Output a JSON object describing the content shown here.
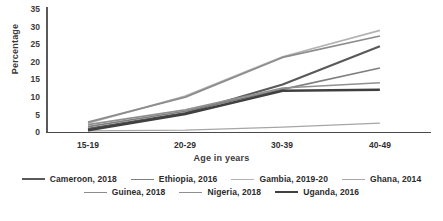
{
  "chart_data": {
    "type": "line",
    "title": "",
    "xlabel": "Age in years",
    "ylabel": "Percentage",
    "categories": [
      "15-19",
      "20-29",
      "30-39",
      "40-49"
    ],
    "ylim": [
      0,
      35
    ],
    "yticks": [
      "0",
      "5",
      "10",
      "15",
      "20",
      "25",
      "30",
      "35"
    ],
    "grid": false,
    "legend_position": "bottom",
    "series": [
      {
        "name": "Cameroon, 2018",
        "values": [
          1.0,
          5.5,
          13.6,
          24.5
        ],
        "color": "#595959"
      },
      {
        "name": "Ethiopia, 2016",
        "values": [
          1.6,
          6.0,
          12.2,
          18.3
        ],
        "color": "#7f7f7f"
      },
      {
        "name": "Gambia, 2019-20",
        "values": [
          2.6,
          10.3,
          21.5,
          29.0
        ],
        "color": "#b3b3b3"
      },
      {
        "name": "Ghana, 2014",
        "values": [
          0.4,
          0.6,
          1.5,
          2.6
        ],
        "color": "#a6a6a6"
      },
      {
        "name": "Guinea, 2018",
        "values": [
          2.9,
          10.0,
          21.3,
          27.4
        ],
        "color": "#8c8c8c"
      },
      {
        "name": "Nigeria, 2018",
        "values": [
          2.2,
          6.4,
          12.6,
          14.1
        ],
        "color": "#909090"
      },
      {
        "name": "Uganda, 2016",
        "values": [
          0.6,
          5.2,
          11.8,
          12.1
        ],
        "color": "#404040"
      }
    ]
  },
  "axis": {
    "y_title": "Percentage",
    "x_title": "Age in years",
    "y_ticks": [
      "35",
      "30",
      "25",
      "20",
      "15",
      "10",
      "5",
      "0"
    ],
    "x_ticks": [
      "15-19",
      "20-29",
      "30-39",
      "40-49"
    ]
  },
  "legend": {
    "row1": [
      {
        "label": "Cameroon, 2018",
        "color": "#595959",
        "width": "2.2px"
      },
      {
        "label": "Ethiopia, 2016",
        "color": "#7f7f7f",
        "width": "1.8px"
      },
      {
        "label": "Gambia, 2019-20",
        "color": "#b3b3b3",
        "width": "1.6px"
      },
      {
        "label": "Ghana, 2014",
        "color": "#a6a6a6",
        "width": "1.4px"
      }
    ],
    "row2": [
      {
        "label": "Guinea, 2018",
        "color": "#8c8c8c",
        "width": "1.8px"
      },
      {
        "label": "Nigeria, 2018",
        "color": "#909090",
        "width": "1.8px"
      },
      {
        "label": "Uganda, 2016",
        "color": "#404040",
        "width": "2.6px"
      }
    ]
  }
}
